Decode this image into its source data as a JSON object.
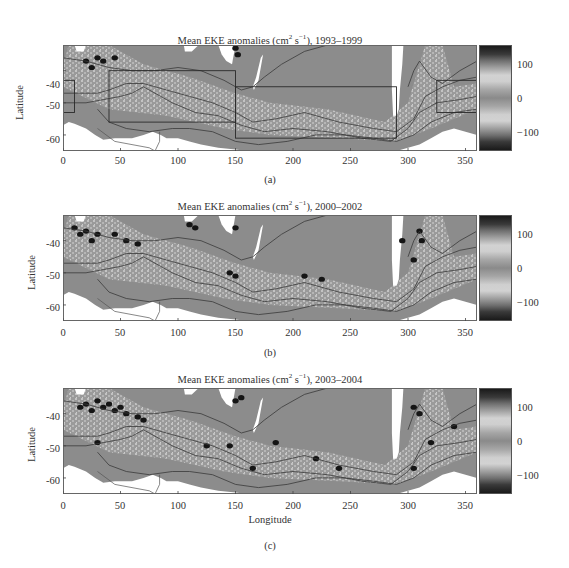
{
  "chart_data": [
    {
      "type": "heatmap",
      "panel_label": "(a)",
      "title": "Mean EKE anomalies (cm² s⁻¹), 1993–1999",
      "xlabel": "",
      "ylabel": "Latitude",
      "xlim": [
        0,
        360
      ],
      "ylim": [
        -65,
        -32
      ],
      "xticks": [
        0,
        50,
        100,
        150,
        200,
        250,
        300,
        350
      ],
      "yticks": [
        -40,
        -50,
        -60
      ],
      "colorbar": {
        "range": [
          -150,
          150
        ],
        "ticks": [
          100,
          0,
          -100
        ]
      },
      "boxes": [
        {
          "lon": [
            0,
            10
          ],
          "lat": [
            -53,
            -43
          ]
        },
        {
          "lon": [
            40,
            150
          ],
          "lat": [
            -56,
            -40
          ]
        },
        {
          "lon": [
            150,
            290
          ],
          "lat": [
            -61,
            -45
          ]
        },
        {
          "lon": [
            325,
            360
          ],
          "lat": [
            -53,
            -43
          ]
        }
      ],
      "dark_patches": [
        [
          20,
          -37
        ],
        [
          25,
          -39
        ],
        [
          30,
          -36
        ],
        [
          35,
          -37
        ],
        [
          45,
          -36
        ],
        [
          150,
          -33
        ],
        [
          152,
          -35
        ]
      ]
    },
    {
      "type": "heatmap",
      "panel_label": "(b)",
      "title": "Mean EKE anomalies (cm² s⁻¹), 2000–2002",
      "xlabel": "",
      "ylabel": "Latitude",
      "xlim": [
        0,
        360
      ],
      "ylim": [
        -65,
        -32
      ],
      "xticks": [
        0,
        50,
        100,
        150,
        200,
        250,
        300,
        350
      ],
      "yticks": [
        -40,
        -50,
        -60
      ],
      "colorbar": {
        "range": [
          -150,
          150
        ],
        "ticks": [
          100,
          0,
          -100
        ]
      },
      "boxes": [],
      "dark_patches": [
        [
          10,
          -36
        ],
        [
          15,
          -38
        ],
        [
          20,
          -37
        ],
        [
          25,
          -40
        ],
        [
          30,
          -38
        ],
        [
          45,
          -38
        ],
        [
          55,
          -40
        ],
        [
          65,
          -41
        ],
        [
          110,
          -35
        ],
        [
          115,
          -36
        ],
        [
          145,
          -50
        ],
        [
          150,
          -51
        ],
        [
          150,
          -36
        ],
        [
          210,
          -51
        ],
        [
          225,
          -52
        ],
        [
          310,
          -37
        ],
        [
          312,
          -40
        ],
        [
          295,
          -40
        ],
        [
          305,
          -46
        ]
      ]
    },
    {
      "type": "heatmap",
      "panel_label": "(c)",
      "title": "Mean EKE anomalies (cm² s⁻¹), 2003–2004",
      "xlabel": "Longitude",
      "ylabel": "Latitude",
      "xlim": [
        0,
        360
      ],
      "ylim": [
        -65,
        -32
      ],
      "xticks": [
        0,
        50,
        100,
        150,
        200,
        250,
        300,
        350
      ],
      "yticks": [
        -40,
        -50,
        -60
      ],
      "colorbar": {
        "range": [
          -150,
          150
        ],
        "ticks": [
          100,
          0,
          -100
        ]
      },
      "boxes": [],
      "dark_patches": [
        [
          15,
          -38
        ],
        [
          20,
          -37
        ],
        [
          25,
          -39
        ],
        [
          30,
          -36
        ],
        [
          35,
          -38
        ],
        [
          40,
          -37
        ],
        [
          45,
          -39
        ],
        [
          50,
          -38
        ],
        [
          55,
          -40
        ],
        [
          65,
          -41
        ],
        [
          70,
          -42
        ],
        [
          30,
          -49
        ],
        [
          125,
          -50
        ],
        [
          145,
          -50
        ],
        [
          150,
          -36
        ],
        [
          155,
          -35
        ],
        [
          185,
          -49
        ],
        [
          165,
          -57
        ],
        [
          220,
          -54
        ],
        [
          240,
          -57
        ],
        [
          305,
          -38
        ],
        [
          310,
          -40
        ],
        [
          305,
          -57
        ],
        [
          320,
          -49
        ],
        [
          340,
          -44
        ]
      ]
    }
  ],
  "panels": [
    {
      "title_main": "Mean EKE anomalies (cm",
      "title_sup1": "2",
      "title_mid": " s",
      "title_sup2": "−1",
      "title_end": "), 1993–1999",
      "ylabel": "Latitude",
      "yticks": [
        "-40",
        "-50",
        "-60"
      ],
      "xticks": [
        "0",
        "50",
        "100",
        "150",
        "200",
        "250",
        "300",
        "350"
      ],
      "cbar_ticks": [
        "100",
        "0",
        "−100"
      ],
      "sublabel": "(a)"
    },
    {
      "title_main": "Mean EKE anomalies (cm",
      "title_sup1": "2",
      "title_mid": " s",
      "title_sup2": "−1",
      "title_end": "), 2000–2002",
      "ylabel": "Latitude",
      "yticks": [
        "-40",
        "-50",
        "-60"
      ],
      "xticks": [
        "0",
        "50",
        "100",
        "150",
        "200",
        "250",
        "300",
        "350"
      ],
      "cbar_ticks": [
        "100",
        "0",
        "−100"
      ],
      "sublabel": "(b)"
    },
    {
      "title_main": "Mean EKE anomalies (cm",
      "title_sup1": "2",
      "title_mid": " s",
      "title_sup2": "−1",
      "title_end": "), 2003–2004",
      "ylabel": "Latitude",
      "yticks": [
        "-40",
        "-50",
        "-60"
      ],
      "xticks": [
        "0",
        "50",
        "100",
        "150",
        "200",
        "250",
        "300",
        "350"
      ],
      "xlabel": "Longitude",
      "cbar_ticks": [
        "100",
        "0",
        "−100"
      ],
      "sublabel": "(c)"
    }
  ],
  "colors": {
    "field": "#8c8c8c",
    "land": "#ffffff",
    "contour": "#3a3a3a",
    "dark_anomaly": "#151515",
    "light_anomaly": "#cdcdcd",
    "box": "#2a2a2a"
  }
}
